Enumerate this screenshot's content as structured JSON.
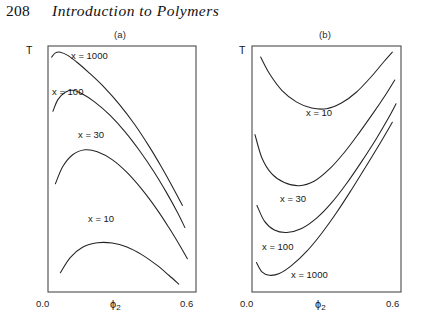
{
  "running_head": {
    "page_number": "208",
    "title": "Introduction to Polymers"
  },
  "figure": {
    "panels": [
      {
        "caption": "(a)",
        "y_axis_label": "T",
        "x_axis_label": "ϕ",
        "x_axis_subscript": "2",
        "x_ticks": [
          "0.0",
          "0.6"
        ],
        "curve_labels": [
          "x = 1000",
          "x = 100",
          "x = 30",
          "x = 10"
        ]
      },
      {
        "caption": "(b)",
        "y_axis_label": "T",
        "x_axis_label": "ϕ",
        "x_axis_subscript": "2",
        "x_ticks": [
          "0.0",
          "0.6"
        ],
        "curve_labels": [
          "x = 10",
          "x = 30",
          "x = 100",
          "x = 1000"
        ]
      }
    ]
  },
  "chart_data": [
    {
      "type": "line",
      "title": "(a)",
      "xlabel": "ϕ₂",
      "ylabel": "T",
      "xlim": [
        0.0,
        0.6
      ],
      "xticks": [
        0.0,
        0.6
      ],
      "grid": false,
      "legend": "inline-labels",
      "description": "Upper critical solution temperature (UCST) binodal curves; each dome peaks and falls with increasing ϕ₂, critical point shifting to lower ϕ₂ and higher T as chain length x increases.",
      "series": [
        {
          "name": "x = 1000",
          "points": [
            [
              0.015,
              0.955
            ],
            [
              0.03,
              0.972
            ],
            [
              0.05,
              0.975
            ],
            [
              0.08,
              0.962
            ],
            [
              0.12,
              0.932
            ],
            [
              0.17,
              0.888
            ],
            [
              0.23,
              0.83
            ],
            [
              0.29,
              0.762
            ],
            [
              0.35,
              0.683
            ],
            [
              0.41,
              0.592
            ],
            [
              0.46,
              0.508
            ],
            [
              0.51,
              0.418
            ],
            [
              0.545,
              0.352
            ]
          ]
        },
        {
          "name": "x = 100",
          "points": [
            [
              0.02,
              0.735
            ],
            [
              0.04,
              0.782
            ],
            [
              0.07,
              0.812
            ],
            [
              0.1,
              0.82
            ],
            [
              0.14,
              0.805
            ],
            [
              0.19,
              0.772
            ],
            [
              0.25,
              0.72
            ],
            [
              0.31,
              0.654
            ],
            [
              0.37,
              0.576
            ],
            [
              0.43,
              0.488
            ],
            [
              0.48,
              0.405
            ],
            [
              0.525,
              0.323
            ],
            [
              0.555,
              0.262
            ]
          ]
        },
        {
          "name": "x = 30",
          "points": [
            [
              0.03,
              0.44
            ],
            [
              0.06,
              0.51
            ],
            [
              0.1,
              0.558
            ],
            [
              0.15,
              0.578
            ],
            [
              0.2,
              0.57
            ],
            [
              0.26,
              0.538
            ],
            [
              0.32,
              0.486
            ],
            [
              0.38,
              0.418
            ],
            [
              0.44,
              0.338
            ],
            [
              0.49,
              0.262
            ],
            [
              0.535,
              0.188
            ],
            [
              0.565,
              0.135
            ]
          ]
        },
        {
          "name": "x = 10",
          "points": [
            [
              0.05,
              0.078
            ],
            [
              0.09,
              0.14
            ],
            [
              0.14,
              0.182
            ],
            [
              0.2,
              0.2
            ],
            [
              0.26,
              0.199
            ],
            [
              0.32,
              0.183
            ],
            [
              0.38,
              0.152
            ],
            [
              0.44,
              0.11
            ],
            [
              0.49,
              0.068
            ],
            [
              0.53,
              0.032
            ]
          ]
        }
      ]
    },
    {
      "type": "line",
      "title": "(b)",
      "xlabel": "ϕ₂",
      "ylabel": "T",
      "xlim": [
        0.0,
        0.6
      ],
      "xticks": [
        0.0,
        0.6
      ],
      "grid": false,
      "legend": "inline-labels",
      "description": "Lower critical solution temperature (LCST) binodal curves; each curve falls to a minimum then rises steeply, the minimum moving to lower ϕ₂ and lower T as chain length x increases.",
      "series": [
        {
          "name": "x = 10",
          "points": [
            [
              0.035,
              0.955
            ],
            [
              0.07,
              0.888
            ],
            [
              0.12,
              0.82
            ],
            [
              0.18,
              0.772
            ],
            [
              0.24,
              0.748
            ],
            [
              0.3,
              0.745
            ],
            [
              0.36,
              0.768
            ],
            [
              0.42,
              0.812
            ],
            [
              0.48,
              0.875
            ],
            [
              0.53,
              0.935
            ],
            [
              0.565,
              0.975
            ]
          ]
        },
        {
          "name": "x = 30",
          "points": [
            [
              0.012,
              0.64
            ],
            [
              0.04,
              0.545
            ],
            [
              0.08,
              0.48
            ],
            [
              0.13,
              0.445
            ],
            [
              0.19,
              0.432
            ],
            [
              0.25,
              0.45
            ],
            [
              0.31,
              0.498
            ],
            [
              0.37,
              0.565
            ],
            [
              0.43,
              0.645
            ],
            [
              0.49,
              0.73
            ],
            [
              0.54,
              0.805
            ],
            [
              0.575,
              0.862
            ]
          ]
        },
        {
          "name": "x = 100",
          "points": [
            [
              0.02,
              0.352
            ],
            [
              0.05,
              0.288
            ],
            [
              0.09,
              0.252
            ],
            [
              0.14,
              0.242
            ],
            [
              0.2,
              0.258
            ],
            [
              0.26,
              0.3
            ],
            [
              0.32,
              0.362
            ],
            [
              0.38,
              0.44
            ],
            [
              0.44,
              0.528
            ],
            [
              0.5,
              0.622
            ],
            [
              0.55,
              0.708
            ],
            [
              0.58,
              0.765
            ]
          ]
        },
        {
          "name": "x = 1000",
          "points": [
            [
              0.018,
              0.12
            ],
            [
              0.04,
              0.082
            ],
            [
              0.07,
              0.068
            ],
            [
              0.11,
              0.075
            ],
            [
              0.16,
              0.108
            ],
            [
              0.22,
              0.165
            ],
            [
              0.28,
              0.238
            ],
            [
              0.34,
              0.322
            ],
            [
              0.4,
              0.415
            ],
            [
              0.46,
              0.512
            ],
            [
              0.52,
              0.612
            ],
            [
              0.565,
              0.69
            ]
          ]
        }
      ]
    }
  ]
}
